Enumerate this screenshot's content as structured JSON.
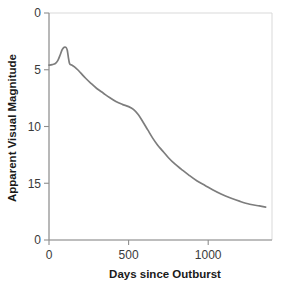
{
  "chart_data": {
    "type": "line",
    "title": "",
    "xlabel": "Days since Outburst",
    "ylabel": "Apparent Visual Magnitude",
    "xlim": [
      0,
      1400
    ],
    "ylim": [
      20,
      0
    ],
    "y_axis_inverted": true,
    "grid": false,
    "legend": null,
    "xticks": [
      0,
      500,
      1000
    ],
    "xtick_labels": [
      "0",
      "500",
      "1000"
    ],
    "yticks": [
      0,
      5,
      10,
      15,
      20
    ],
    "ytick_labels": [
      "0",
      "5",
      "10",
      "15",
      "0"
    ],
    "series": [
      {
        "name": "Nova light curve",
        "color": "#7d7d7d",
        "x": [
          0,
          20,
          40,
          55,
          70,
          82,
          92,
          100,
          108,
          115,
          122,
          128,
          135,
          145,
          160,
          180,
          200,
          230,
          260,
          300,
          340,
          380,
          420,
          460,
          500,
          530,
          560,
          590,
          620,
          650,
          680,
          710,
          750,
          790,
          830,
          880,
          930,
          980,
          1030,
          1080,
          1140,
          1200,
          1260,
          1320,
          1360
        ],
        "y": [
          4.6,
          4.55,
          4.45,
          4.2,
          3.7,
          3.25,
          3.05,
          3.0,
          3.05,
          3.3,
          3.95,
          4.4,
          4.55,
          4.6,
          4.75,
          5.0,
          5.3,
          5.75,
          6.15,
          6.65,
          7.05,
          7.45,
          7.8,
          8.05,
          8.25,
          8.5,
          8.95,
          9.6,
          10.3,
          11.0,
          11.6,
          12.1,
          12.75,
          13.3,
          13.75,
          14.3,
          14.8,
          15.2,
          15.6,
          15.95,
          16.3,
          16.6,
          16.85,
          17.0,
          17.1
        ]
      }
    ],
    "annotations": {
      "peak_magnitude": 3.0,
      "peak_day": 100,
      "pre_peak_magnitude": 4.6,
      "final_magnitude": 17.1,
      "final_day": 1360
    }
  },
  "axes": {
    "y_title": "Apparent Visual Magnitude",
    "x_title": "Days since Outburst"
  }
}
